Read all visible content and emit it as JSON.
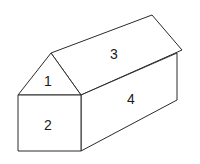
{
  "diagram": {
    "type": "3d-house-faces",
    "faces": [
      {
        "id": "1",
        "label": "1",
        "shape": "triangle",
        "position": "front gable"
      },
      {
        "id": "2",
        "label": "2",
        "shape": "rectangle",
        "position": "front wall"
      },
      {
        "id": "3",
        "label": "3",
        "shape": "parallelogram",
        "position": "roof"
      },
      {
        "id": "4",
        "label": "4",
        "shape": "parallelogram",
        "position": "side wall"
      }
    ],
    "colors": {
      "stroke": "#2a2a2a",
      "fill": "#ffffff",
      "text": "#1a1a1a"
    }
  }
}
